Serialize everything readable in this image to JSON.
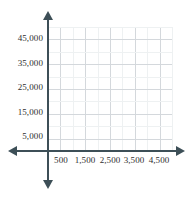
{
  "chart_data": {
    "type": "scatter",
    "title": "",
    "subtitle": "",
    "xlabel": "",
    "ylabel": "",
    "grid": true,
    "legend": null,
    "series": [],
    "x": [],
    "values": [],
    "xlim": [
      0,
      5000
    ],
    "ylim": [
      0,
      50000
    ],
    "x_tick_step": 500,
    "y_tick_step": 5000,
    "x_labeled_ticks": [
      "500",
      "1,500",
      "2,500",
      "3,500",
      "4,500"
    ],
    "x_labeled_values": [
      500,
      1500,
      2500,
      3500,
      4500
    ],
    "y_labeled_ticks": [
      "5,000",
      "15,000",
      "25,000",
      "35,000",
      "45,000"
    ],
    "y_labeled_values": [
      5000,
      15000,
      25000,
      35000,
      45000
    ]
  },
  "axes": {
    "color": "#3d4f57",
    "y_axis_name": "vertical-axis",
    "x_axis_name": "horizontal-axis",
    "arrow_up": "arrow-up",
    "arrow_down": "arrow-down",
    "arrow_left": "arrow-left",
    "arrow_right": "arrow-right"
  },
  "gridlines": {
    "major_color": "#d4d8dc",
    "minor_color": "#eef1f2",
    "vertical_count": 10,
    "horizontal_count": 10
  },
  "y_ticks": [
    {
      "label": "45,000",
      "value": 45000,
      "top": 33
    },
    {
      "label": "35,000",
      "value": 35000,
      "top": 58
    },
    {
      "label": "25,000",
      "value": 25000,
      "top": 82
    },
    {
      "label": "15,000",
      "value": 15000,
      "top": 107
    },
    {
      "label": "5,000",
      "value": 5000,
      "top": 131
    }
  ],
  "x_ticks": [
    {
      "label": "500",
      "value": 500,
      "left": 61
    },
    {
      "label": "1,500",
      "value": 1500,
      "left": 85
    },
    {
      "label": "2,500",
      "value": 2500,
      "left": 110
    },
    {
      "label": "3,500",
      "value": 3500,
      "left": 134
    },
    {
      "label": "4,500",
      "value": 4500,
      "left": 159
    }
  ]
}
